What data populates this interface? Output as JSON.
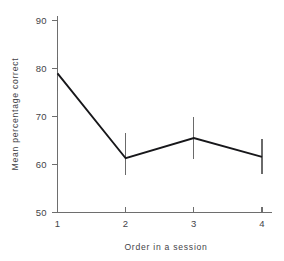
{
  "chart_data": {
    "type": "line",
    "title": "",
    "subtitle": "",
    "xlabel": "Order in a session",
    "ylabel": "Mean percentage correct",
    "x": [
      1,
      2,
      3,
      4
    ],
    "categories": [
      "1",
      "2",
      "3",
      "4"
    ],
    "values": [
      79.0,
      61.3,
      65.5,
      61.6
    ],
    "series": [
      {
        "name": "Mean percentage correct",
        "values": [
          79.0,
          61.3,
          65.5,
          61.6
        ],
        "error_low": [
          75.4,
          57.8,
          61.2,
          58.0
        ],
        "error_high": [
          82.3,
          66.5,
          69.8,
          65.3
        ],
        "color": "#17171a"
      }
    ],
    "xlim": [
      0.6,
      4.35
    ],
    "ylim": [
      50,
      92
    ],
    "xticks": [
      1,
      2,
      3,
      4
    ],
    "xtick_labels": [
      "1",
      "2",
      "3",
      "4"
    ],
    "yticks": [
      50,
      60,
      70,
      80,
      90
    ],
    "ytick_labels": [
      "50",
      "60",
      "70",
      "80",
      "90"
    ],
    "grid": false,
    "legend": null,
    "error_bars": true,
    "error_bar_style": "plain-vertical-no-caps",
    "markers": false,
    "annotations": []
  },
  "axes": {
    "y_title": "Mean percentage correct",
    "x_title": "Order in a session"
  }
}
